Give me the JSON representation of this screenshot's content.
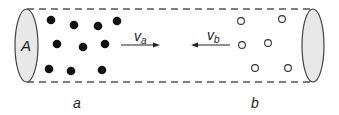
{
  "diagram": {
    "cross_section_label": "A",
    "left_region_label": "a",
    "right_region_label": "b",
    "velocity_a": {
      "symbol": "v",
      "subscript": "a",
      "direction": "right"
    },
    "velocity_b": {
      "symbol": "v",
      "subscript": "b",
      "direction": "left"
    },
    "particles_a": {
      "style": "filled",
      "color": "#111111",
      "points": [
        [
          51,
          20
        ],
        [
          74,
          25
        ],
        [
          98,
          26
        ],
        [
          117,
          21
        ],
        [
          57,
          44
        ],
        [
          83,
          47
        ],
        [
          105,
          44
        ],
        [
          49,
          69
        ],
        [
          71,
          71
        ],
        [
          102,
          70
        ]
      ]
    },
    "particles_b": {
      "style": "hollow",
      "color": "#333333",
      "points": [
        [
          241,
          21
        ],
        [
          282,
          19
        ],
        [
          242,
          45
        ],
        [
          268,
          43
        ],
        [
          255,
          68
        ],
        [
          288,
          68
        ]
      ]
    },
    "colors": {
      "ellipse_fill": "#e8e8e8",
      "outline": "#444444",
      "dash": "#555555"
    }
  }
}
